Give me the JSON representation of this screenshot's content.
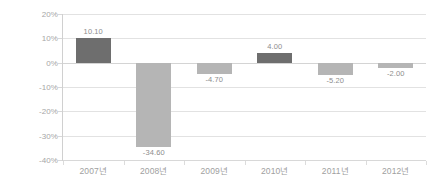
{
  "chart_data": {
    "type": "bar",
    "title": "",
    "xlabel": "",
    "ylabel": "",
    "categories": [
      "2007년",
      "2008년",
      "2009년",
      "2010년",
      "2011년",
      "2012년"
    ],
    "values": [
      10.1,
      -34.6,
      -4.7,
      4.0,
      -5.2,
      -2.0
    ],
    "data_labels": [
      "10.10",
      "-34.60",
      "-4.70",
      "4.00",
      "-5.20",
      "-2.00"
    ],
    "ylim": [
      -40,
      20
    ],
    "ytick_values": [
      20,
      10,
      0,
      -10,
      -20,
      -30,
      -40
    ],
    "ytick_labels": [
      "20%",
      "10%",
      "0%",
      "-10%",
      "-20%",
      "-30%",
      "-40%"
    ],
    "grid": true,
    "legend": "none",
    "colors": {
      "positive_bar": "#6e6e6e",
      "negative_bar": "#b5b5b5",
      "gridline": "#e2e2e2",
      "axis": "#d0d0d0",
      "tick_label": "#a0a0a0",
      "data_label": "#8d8d8d",
      "background": "#ffffff"
    }
  }
}
